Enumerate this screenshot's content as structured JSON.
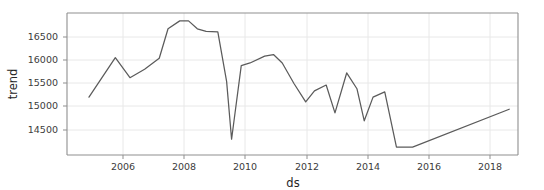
{
  "chart_data": {
    "type": "line",
    "title": "",
    "xlabel": "ds",
    "ylabel": "trend",
    "xlim": [
      2004.0,
      2019.4
    ],
    "ylim": [
      14200,
      16900
    ],
    "grid": true,
    "legend": "none",
    "line_color": "#5b5b5b",
    "grid_color": "#e8e8e8",
    "axes_color": "#9a9a9a",
    "background": "#ffffff",
    "xticks": [
      2006,
      2008,
      2010,
      2012,
      2014,
      2016,
      2018
    ],
    "xtick_labels": [
      "2006",
      "2008",
      "2010",
      "2012",
      "2014",
      "2016",
      "2018"
    ],
    "yticks": [
      14500,
      15000,
      15500,
      16000,
      16500
    ],
    "ytick_labels": [
      "14500",
      "15000",
      "15500",
      "16000",
      "16500"
    ],
    "series": [
      {
        "name": "trend",
        "x": [
          2004.75,
          2005.65,
          2006.15,
          2006.65,
          2007.15,
          2007.45,
          2007.85,
          2008.15,
          2008.45,
          2008.75,
          2009.15,
          2009.45,
          2009.62,
          2009.95,
          2010.25,
          2010.75,
          2011.05,
          2011.35,
          2011.75,
          2012.15,
          2012.45,
          2012.85,
          2013.15,
          2013.55,
          2013.9,
          2014.15,
          2014.45,
          2014.85,
          2015.25,
          2015.55,
          2015.8,
          2019.1
        ],
        "y": [
          15300,
          16050,
          15670,
          15830,
          16040,
          16600,
          16750,
          16750,
          16600,
          16550,
          16540,
          15600,
          14500,
          15900,
          15950,
          16080,
          16110,
          15950,
          15560,
          15210,
          15420,
          15530,
          15000,
          15760,
          15460,
          14850,
          15300,
          15400,
          14350,
          14350,
          14350,
          15070
        ]
      }
    ]
  },
  "axis": {
    "xlabel": "ds",
    "ylabel": "trend"
  }
}
